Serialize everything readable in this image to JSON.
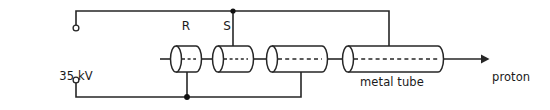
{
  "figure": {
    "type": "physics-schematic",
    "title_visible": false,
    "background_color": "#ffffff",
    "line_color": "#262626",
    "text_color": "#1a1a1a"
  },
  "labels": {
    "supply_line1": "35 kV",
    "supply_line2": "alternating supply",
    "tube_r": "R",
    "tube_s": "S",
    "metal_tube": "metal tube",
    "beam_line1": "proton",
    "beam_line2": "beam"
  },
  "components": {
    "drift_tubes": [
      {
        "name": "R",
        "left": 176,
        "right": 196,
        "radius_y": 13,
        "label": "R"
      },
      {
        "name": "S",
        "left": 218,
        "right": 248,
        "radius_y": 13,
        "label": "S"
      },
      {
        "name": "third-tube",
        "left": 272,
        "right": 322,
        "radius_y": 13,
        "label": ""
      },
      {
        "name": "metal-tube",
        "left": 348,
        "right": 438,
        "radius_y": 13,
        "label": "metal tube"
      }
    ],
    "terminals": [
      {
        "name": "top-terminal",
        "x": 76,
        "y": 28
      },
      {
        "name": "bottom-terminal",
        "x": 76,
        "y": 80
      }
    ],
    "junction_dots": [
      {
        "name": "junction-s-top",
        "x": 233,
        "y": 11
      },
      {
        "name": "junction-r-bottom",
        "x": 187,
        "y": 97
      }
    ],
    "beam_axis_y": 59,
    "arrow": {
      "from_x": 438,
      "to_x": 487,
      "y": 59
    }
  }
}
